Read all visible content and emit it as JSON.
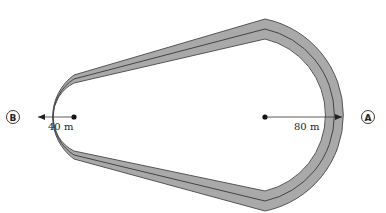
{
  "diagram": {
    "points": [
      {
        "id": "A",
        "label": "A"
      },
      {
        "id": "B",
        "label": "B"
      }
    ],
    "radii": {
      "small": {
        "label": "40 m",
        "value_m": 40,
        "end": "B"
      },
      "large": {
        "label": "80 m",
        "value_m": 80,
        "end": "A"
      }
    },
    "colors": {
      "track_fill": "#a9a9a9",
      "track_edge": "#555555",
      "center_line": "#444444",
      "background": "#ffffff"
    }
  }
}
